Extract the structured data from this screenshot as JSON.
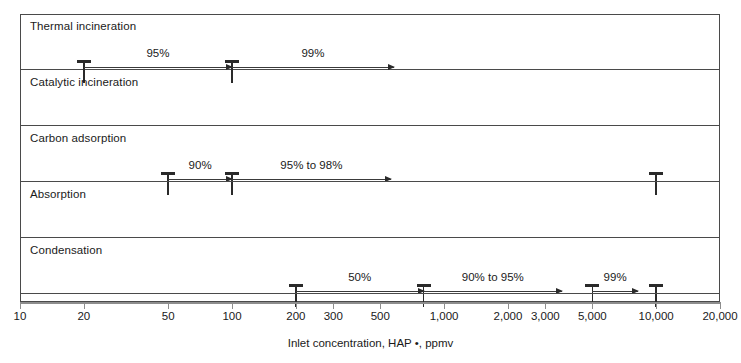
{
  "chart_data": {
    "type": "bar",
    "title": "",
    "xlabel": "Inlet concentration, HAP •, ppmv",
    "ylabel": "",
    "xscale": "log",
    "xlim": [
      10,
      20000
    ],
    "grid": false,
    "legend": "none",
    "axis_ticks": [
      {
        "value": 10,
        "label": "10"
      },
      {
        "value": 20,
        "label": "20"
      },
      {
        "value": 50,
        "label": "50"
      },
      {
        "value": 100,
        "label": "100"
      },
      {
        "value": 200,
        "label": "200"
      },
      {
        "value": 300,
        "label": "300"
      },
      {
        "value": 500,
        "label": "500"
      },
      {
        "value": 1000,
        "label": "1,000"
      },
      {
        "value": 2000,
        "label": "2,000"
      },
      {
        "value": 3000,
        "label": "3,000"
      },
      {
        "value": 5000,
        "label": "5,000"
      },
      {
        "value": 10000,
        "label": "10,000"
      },
      {
        "value": 20000,
        "label": "20,000"
      }
    ],
    "categories": [
      "Thermal incineration",
      "Catalytic incineration",
      "Carbon adsorption",
      "Absorption",
      "Condensation"
    ],
    "rows": [
      {
        "label": "Thermal incineration",
        "segments": [
          {
            "start": 20,
            "end": 100,
            "label": "95%",
            "arrow": true
          },
          {
            "start": 100,
            "end": 580,
            "label": "99%",
            "arrow": true
          }
        ],
        "endpoints": [
          20,
          100
        ]
      },
      {
        "label": "Catalytic incineration",
        "segments": [
          {
            "start": 50,
            "end": 100,
            "label": "90%",
            "arrow": true
          },
          {
            "start": 100,
            "end": 560,
            "label": "95% to 98%",
            "arrow": true
          }
        ],
        "endpoints": [
          50,
          100,
          10000
        ]
      },
      {
        "label": "Carbon adsorption",
        "segments": [
          {
            "start": 200,
            "end": 800,
            "label": "50%",
            "arrow": true
          },
          {
            "start": 800,
            "end": 3600,
            "label": "90% to 95%",
            "arrow": true
          },
          {
            "start": 5000,
            "end": 8200,
            "label": "99%",
            "arrow": true
          }
        ],
        "endpoints": [
          200,
          800,
          5000,
          10000
        ]
      },
      {
        "label": "Absorption",
        "segments": [
          {
            "start": 300,
            "end": 460,
            "label": "90%",
            "arrow": true
          },
          {
            "start": 500,
            "end": 1700,
            "label": "95%",
            "arrow": true
          },
          {
            "start": 3000,
            "end": 5200,
            "label": "98%",
            "arrow": true
          }
        ],
        "endpoints": [
          300,
          500,
          3000,
          5200
        ]
      },
      {
        "label": "Condensation",
        "segments": [
          {
            "start": 500,
            "end": 1700,
            "label": "50%",
            "arrow": true
          },
          {
            "start": 2800,
            "end": 4200,
            "label": "80%",
            "arrow": true
          },
          {
            "start": 10000,
            "end": 19000,
            "label": "95%",
            "arrow": true
          }
        ],
        "endpoints": [
          500,
          2800,
          10000
        ]
      }
    ]
  },
  "colors": {
    "frame": "#4a4a4a",
    "marker": "#2a2a2a",
    "axis": "#8d8d8d",
    "text": "#1a1a1a",
    "background": "#ffffff"
  }
}
